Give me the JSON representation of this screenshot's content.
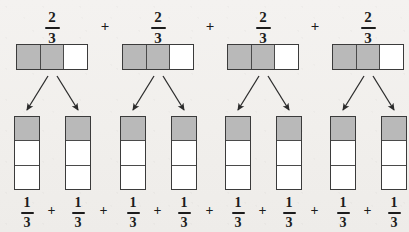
{
  "diagram": {
    "background_color": "#f2f1ee",
    "shaded_color": "#b9b9b9",
    "unshaded_color": "#ffffff",
    "border_color": "#3b3b3b",
    "text_color": "#1c1c1c"
  },
  "top_row": {
    "operator": "+",
    "terms": [
      {
        "label_numerator": "2",
        "label_denominator": "3",
        "cells": [
          "shaded",
          "shaded",
          "empty"
        ],
        "cell_count": 3,
        "shaded_count": 2
      },
      {
        "label_numerator": "2",
        "label_denominator": "3",
        "cells": [
          "shaded",
          "shaded",
          "empty"
        ],
        "cell_count": 3,
        "shaded_count": 2
      },
      {
        "label_numerator": "2",
        "label_denominator": "3",
        "cells": [
          "shaded",
          "shaded",
          "empty"
        ],
        "cell_count": 3,
        "shaded_count": 2
      },
      {
        "label_numerator": "2",
        "label_denominator": "3",
        "cells": [
          "shaded",
          "shaded",
          "empty"
        ],
        "cell_count": 3,
        "shaded_count": 2
      }
    ]
  },
  "bottom_row": {
    "operator": "+",
    "terms": [
      {
        "label_numerator": "1",
        "label_denominator": "3",
        "cells": [
          "shaded",
          "empty",
          "empty"
        ],
        "cell_count": 3,
        "shaded_count": 1
      },
      {
        "label_numerator": "1",
        "label_denominator": "3",
        "cells": [
          "shaded",
          "empty",
          "empty"
        ],
        "cell_count": 3,
        "shaded_count": 1
      },
      {
        "label_numerator": "1",
        "label_denominator": "3",
        "cells": [
          "shaded",
          "empty",
          "empty"
        ],
        "cell_count": 3,
        "shaded_count": 1
      },
      {
        "label_numerator": "1",
        "label_denominator": "3",
        "cells": [
          "shaded",
          "empty",
          "empty"
        ],
        "cell_count": 3,
        "shaded_count": 1
      },
      {
        "label_numerator": "1",
        "label_denominator": "3",
        "cells": [
          "shaded",
          "empty",
          "empty"
        ],
        "cell_count": 3,
        "shaded_count": 1
      },
      {
        "label_numerator": "1",
        "label_denominator": "3",
        "cells": [
          "shaded",
          "empty",
          "empty"
        ],
        "cell_count": 3,
        "shaded_count": 1
      },
      {
        "label_numerator": "1",
        "label_denominator": "3",
        "cells": [
          "shaded",
          "empty",
          "empty"
        ],
        "cell_count": 3,
        "shaded_count": 1
      },
      {
        "label_numerator": "1",
        "label_denominator": "3",
        "cells": [
          "shaded",
          "empty",
          "empty"
        ],
        "cell_count": 3,
        "shaded_count": 1
      }
    ]
  },
  "arrows": {
    "count": 8,
    "description": "each two-thirds bar splits into two one-third bars"
  }
}
